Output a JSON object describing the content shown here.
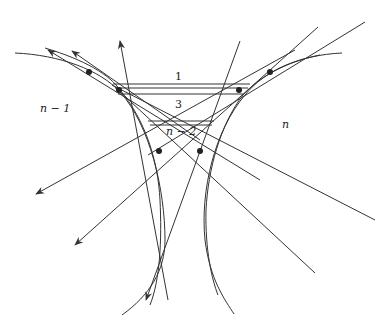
{
  "diagram": {
    "stroke_color": "#333333",
    "region_labels": [
      {
        "id": "n-minus-1",
        "text": "n − 1",
        "x": 40,
        "y": 112
      },
      {
        "id": "n",
        "text": "n",
        "x": 282,
        "y": 128
      },
      {
        "id": "1",
        "text": "1",
        "x": 177,
        "y": 80
      },
      {
        "id": "3",
        "text": "3",
        "x": 177,
        "y": 108
      },
      {
        "id": "n-minus-2",
        "text": "n − 2",
        "x": 178,
        "y": 135
      }
    ]
  }
}
